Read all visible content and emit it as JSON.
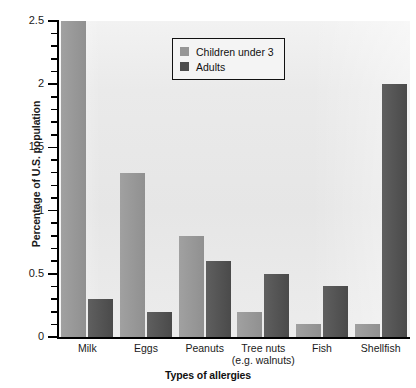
{
  "chart_data": {
    "type": "bar",
    "title": "",
    "xlabel": "Types of allergies",
    "ylabel": "Percentage of U.S. population",
    "categories": [
      "Milk",
      "Eggs",
      "Peanuts",
      "Tree nuts\n(e.g. walnuts)",
      "Fish",
      "Shellfish"
    ],
    "series": [
      {
        "name": "Children under 3",
        "color": "#969696",
        "values": [
          2.5,
          1.3,
          0.8,
          0.2,
          0.1,
          0.1
        ]
      },
      {
        "name": "Adults",
        "color": "#4d4d4d",
        "values": [
          0.3,
          0.2,
          0.6,
          0.5,
          0.4,
          2.0
        ]
      }
    ],
    "ylim": [
      0,
      2.5
    ],
    "y_major_ticks": [
      0,
      0.5,
      1,
      1.5,
      2,
      2.5
    ],
    "y_major_tick_labels": [
      "0",
      "0.5",
      "1",
      "1.5",
      "2",
      "2.5"
    ],
    "y_minor_tick_step": 0.1,
    "grid": false,
    "legend_position": "upper-center-left",
    "plot_background": "#e9e9e9",
    "axis_color": "#000000"
  },
  "legend": {
    "entries": [
      {
        "label": "Children under 3",
        "swatch": "light"
      },
      {
        "label": "Adults",
        "swatch": "dark"
      }
    ]
  },
  "axes": {
    "y_title": "Percentage of U.S. population",
    "x_title": "Types of allergies"
  }
}
